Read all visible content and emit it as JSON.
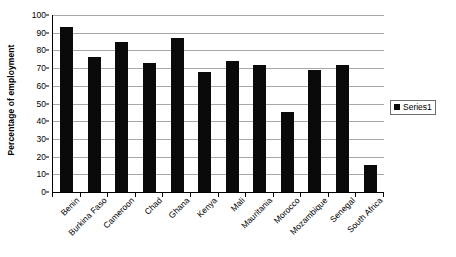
{
  "chart_data": {
    "type": "bar",
    "title": "",
    "subtitle": "",
    "xlabel": "",
    "ylabel": "Percentage of employment",
    "ylim": [
      0,
      100
    ],
    "ytick_step": 10,
    "yticks": [
      0,
      10,
      20,
      30,
      40,
      50,
      60,
      70,
      80,
      90,
      100
    ],
    "ytick_labels": [
      "0",
      "10",
      "20",
      "30",
      "40",
      "50",
      "60",
      "70",
      "80",
      "90",
      "100"
    ],
    "grid": "horizontal",
    "legend_position": "right",
    "categories": [
      "Benin",
      "Burkina Faso",
      "Cameroon",
      "Chad",
      "Ghana",
      "Kenya",
      "Mali",
      "Mauritania",
      "Morocco",
      "Mozambique",
      "Senegal",
      "South Africa"
    ],
    "series": [
      {
        "name": "Series1",
        "color": "#0a0a0a",
        "values": [
          93,
          76,
          85,
          73,
          87,
          68,
          74,
          72,
          45,
          69,
          72,
          15
        ]
      }
    ]
  },
  "legend": {
    "entries": [
      {
        "label": "Series1",
        "marker": "filled-square",
        "color": "#0a0a0a"
      }
    ]
  },
  "style": {
    "background": "#ffffff",
    "gridline_color": "#a8a8a8",
    "axis_color": "#000000",
    "bar_color": "#0a0a0a",
    "legend_border": "#6e6e6e"
  }
}
